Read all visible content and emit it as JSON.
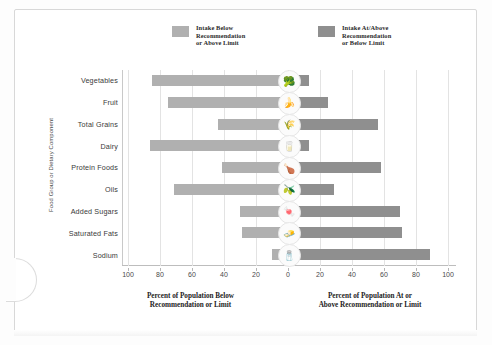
{
  "legend": {
    "below": {
      "label": "Intake Below\nRecommendation\nor Above Limit",
      "color": "#b0b0b0",
      "swatch_name": "legend-swatch-below"
    },
    "above": {
      "label": "Intake At/Above\nRecommendation\nor Below Limit",
      "color": "#8f8f8f",
      "swatch_name": "legend-swatch-above"
    }
  },
  "axes": {
    "y_title": "Food Group or Dietary Component",
    "x_title_left": "Percent of Population Below\nRecommendation or Limit",
    "x_title_right": "Percent of Population At or\nAbove Recommendation or Limit",
    "tick_labels": [
      "100",
      "80",
      "60",
      "40",
      "20",
      "0",
      "20",
      "40",
      "60",
      "80",
      "100"
    ]
  },
  "chart_data": {
    "type": "bar",
    "title": "",
    "subtitle": "",
    "orientation": "horizontal",
    "style": "diverging",
    "xlabel": "Percent of Population",
    "ylabel": "Food Group or Dietary Component",
    "xlim": [
      -100,
      100
    ],
    "grid": true,
    "legend_position": "top",
    "categories": [
      "Vegetables",
      "Fruit",
      "Total Grains",
      "Dairy",
      "Protein Foods",
      "Oils",
      "Added Sugars",
      "Saturated Fats",
      "Sodium"
    ],
    "icons": [
      "🥦",
      "🍌",
      "🌾",
      "🥛",
      "🍗",
      "🫒",
      "🍬",
      "🧈",
      "🧂"
    ],
    "icon_names": [
      "vegetables-icon",
      "fruit-icon",
      "total-grains-icon",
      "dairy-icon",
      "protein-foods-icon",
      "oils-icon",
      "added-sugars-icon",
      "saturated-fats-icon",
      "sodium-icon"
    ],
    "series": [
      {
        "name": "Intake Below Recommendation or Above Limit",
        "side": "left",
        "color": "#b0b0b0",
        "values": [
          85,
          75,
          44,
          86,
          41,
          71,
          30,
          29,
          10
        ]
      },
      {
        "name": "Intake At/Above Recommendation or Below Limit",
        "side": "right",
        "color": "#8f8f8f",
        "values": [
          13,
          25,
          56,
          13,
          58,
          29,
          70,
          71,
          89
        ]
      }
    ],
    "tick_values": [
      100,
      80,
      60,
      40,
      20,
      0,
      20,
      40,
      60,
      80,
      100
    ]
  }
}
